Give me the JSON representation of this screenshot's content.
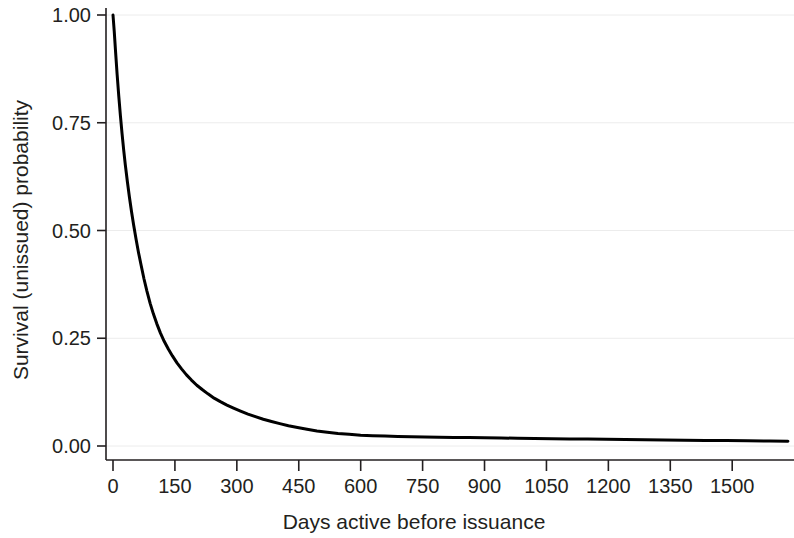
{
  "chart_data": {
    "type": "line",
    "title": "",
    "subtitle": "",
    "xlabel": "Days active before issuance",
    "ylabel": "Survival (unissued) probability",
    "xlim": [
      0,
      1640
    ],
    "ylim": [
      0,
      1.0
    ],
    "grid": true,
    "grid_orientation": "horizontal",
    "legend": "none",
    "line_color": "#000000",
    "line_width": 3,
    "background_color": "#ffffff",
    "axis_color": "#231f20",
    "gridline_color": "#ececec",
    "xticks": [
      0,
      150,
      300,
      450,
      600,
      750,
      900,
      1050,
      1200,
      1350,
      1500
    ],
    "xtick_labels": [
      "0",
      "150",
      "300",
      "450",
      "600",
      "750",
      "900",
      "1050",
      "1200",
      "1350",
      "1500"
    ],
    "yticks": [
      0.0,
      0.25,
      0.5,
      0.75,
      1.0
    ],
    "ytick_labels": [
      "0.00",
      "0.25",
      "0.50",
      "0.75",
      "1.00"
    ],
    "series": [
      {
        "name": "Survival (unissued) probability",
        "x": [
          0,
          3,
          6,
          10,
          14,
          18,
          22,
          26,
          30,
          35,
          40,
          45,
          50,
          56,
          62,
          68,
          75,
          82,
          90,
          98,
          106,
          115,
          124,
          134,
          144,
          155,
          166,
          178,
          190,
          203,
          216,
          230,
          245,
          260,
          276,
          292,
          309,
          327,
          345,
          364,
          384,
          404,
          425,
          447,
          470,
          494,
          519,
          545,
          572,
          600,
          629,
          659,
          690,
          722,
          755,
          790,
          826,
          863,
          901,
          940,
          980,
          1021,
          1063,
          1106,
          1150,
          1195,
          1241,
          1288,
          1336,
          1385,
          1435,
          1486,
          1538,
          1591,
          1635
        ],
        "y": [
          1.0,
          0.962,
          0.918,
          0.862,
          0.812,
          0.766,
          0.724,
          0.686,
          0.651,
          0.612,
          0.576,
          0.543,
          0.513,
          0.479,
          0.448,
          0.42,
          0.388,
          0.36,
          0.331,
          0.306,
          0.284,
          0.262,
          0.243,
          0.225,
          0.209,
          0.193,
          0.179,
          0.165,
          0.153,
          0.141,
          0.131,
          0.121,
          0.111,
          0.103,
          0.095,
          0.088,
          0.081,
          0.074,
          0.068,
          0.062,
          0.057,
          0.052,
          0.047,
          0.043,
          0.039,
          0.035,
          0.032,
          0.029,
          0.027,
          0.025,
          0.024,
          0.023,
          0.022,
          0.0215,
          0.021,
          0.0205,
          0.02,
          0.0195,
          0.019,
          0.0185,
          0.018,
          0.0175,
          0.017,
          0.0165,
          0.016,
          0.0155,
          0.015,
          0.0145,
          0.014,
          0.0135,
          0.013,
          0.0125,
          0.012,
          0.0115,
          0.011
        ]
      }
    ]
  }
}
